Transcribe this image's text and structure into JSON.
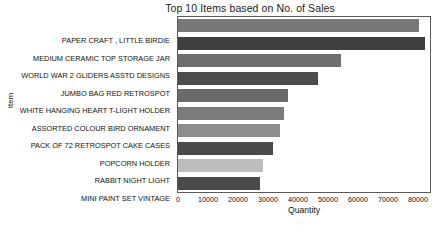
{
  "chart_data": {
    "type": "bar",
    "orientation": "horizontal",
    "title": "Top 10 Items based on No. of Sales",
    "xlabel": "Quantity",
    "ylabel": "Item",
    "grid": false,
    "legend": false,
    "xlim": [
      0,
      84000
    ],
    "xticks": [
      0,
      10000,
      20000,
      30000,
      40000,
      50000,
      60000,
      70000,
      80000
    ],
    "xtick_labels": [
      "0",
      "10000",
      "20000",
      "30000",
      "40000",
      "50000",
      "60000",
      "70000",
      "80000"
    ],
    "categories": [
      "PAPER CRAFT , LITTLE BIRDIE",
      "MEDIUM CERAMIC TOP STORAGE JAR",
      "WORLD WAR 2 GLIDERS ASSTD DESIGNS",
      "JUMBO BAG RED RETROSPOT",
      "WHITE HANGING HEART T-LIGHT HOLDER",
      "ASSORTED COLOUR BIRD ORNAMENT",
      "PACK OF 72 RETROSPOT CAKE CASES",
      "POPCORN HOLDER",
      "RABBIT NIGHT LIGHT",
      "MINI PAINT SET VINTAGE"
    ],
    "values": [
      80200,
      82200,
      54400,
      46700,
      36800,
      35200,
      33900,
      31700,
      28200,
      27200
    ],
    "bar_colors": [
      "#787878",
      "#3f3f3f",
      "#6e6e6e",
      "#4c4c4c",
      "#6a6a6a",
      "#7b7b7b",
      "#8d8d8d",
      "#4a4a4a",
      "#bdbdbd",
      "#4a4a4a"
    ]
  },
  "colors": {
    "background": "#ffffff",
    "frame": "#5a5a5a",
    "text": "#111111"
  }
}
